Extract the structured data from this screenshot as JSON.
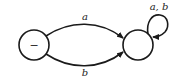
{
  "diagram": {
    "type": "finite-automaton",
    "states": [
      {
        "id": "s0",
        "label": "−",
        "initial": true,
        "cx": 34,
        "cy": 45,
        "r": 15
      },
      {
        "id": "s1",
        "label": "",
        "initial": false,
        "cx": 138,
        "cy": 45,
        "r": 15
      }
    ],
    "transitions": [
      {
        "from": "s0",
        "to": "s1",
        "label": "a"
      },
      {
        "from": "s0",
        "to": "s1",
        "label": "b"
      },
      {
        "from": "s1",
        "to": "s1",
        "label": "a, b"
      }
    ],
    "stroke_color": "#1a1a1a"
  }
}
